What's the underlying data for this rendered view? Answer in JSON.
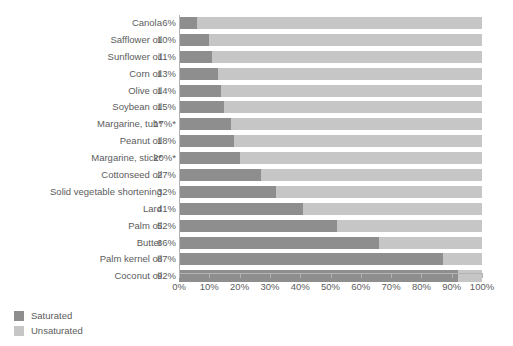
{
  "chart_data": {
    "type": "bar",
    "orientation": "horizontal",
    "stacked": true,
    "title": "",
    "subtitle": "",
    "xlabel": "",
    "ylabel": "",
    "xlim": [
      0,
      100
    ],
    "grid": false,
    "legend_position": "bottom-left",
    "categories": [
      "Canola",
      "Safflower oil",
      "Sunflower oil",
      "Corn oil",
      "Olive oil",
      "Soybean oil",
      "Margarine, tub*",
      "Peanut oil",
      "Margarine, stick*",
      "Cottonseed oil",
      "Solid vegetable shortening",
      "Lard",
      "Palm oil",
      "Butter",
      "Palm kernel oil",
      "Coconut oil"
    ],
    "value_labels": [
      "6%",
      "10%",
      "11%",
      "13%",
      "14%",
      "15%",
      "17%*",
      "18%",
      "20%*",
      "27%",
      "32%",
      "41%",
      "52%",
      "66%",
      "87%",
      "92%"
    ],
    "series": [
      {
        "name": "Saturated",
        "color": "#8e8e8e",
        "values": [
          6,
          10,
          11,
          13,
          14,
          15,
          17,
          18,
          20,
          27,
          32,
          41,
          52,
          66,
          87,
          92
        ]
      },
      {
        "name": "Unsaturated",
        "color": "#c6c6c6",
        "values": [
          94,
          90,
          89,
          87,
          86,
          85,
          83,
          82,
          80,
          73,
          68,
          59,
          48,
          34,
          13,
          8
        ]
      }
    ],
    "xticks": [
      0,
      10,
      20,
      30,
      40,
      50,
      60,
      70,
      80,
      90,
      100
    ],
    "xticklabels": [
      "0%",
      "10%",
      "20%",
      "30%",
      "40%",
      "50%",
      "60%",
      "70%",
      "80%",
      "90%",
      "100%"
    ]
  },
  "legend": {
    "items": [
      {
        "label": "Saturated",
        "color": "#8e8e8e"
      },
      {
        "label": "Unsaturated",
        "color": "#c6c6c6"
      }
    ]
  },
  "colors": {
    "saturated": "#8e8e8e",
    "unsaturated": "#c6c6c6",
    "axis": "#b4b4b4",
    "text": "#5c5c5c",
    "background": "#ffffff"
  }
}
